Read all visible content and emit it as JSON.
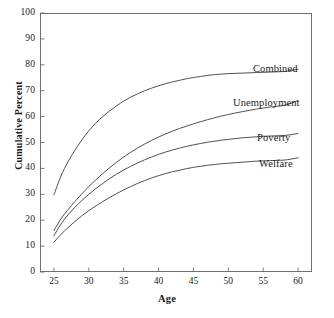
{
  "chart_data": {
    "type": "line",
    "title": "",
    "xlabel": "Age",
    "ylabel": "Cumulative Percent",
    "xlim": [
      23,
      62
    ],
    "ylim": [
      0,
      100
    ],
    "xticks": [
      25,
      30,
      35,
      40,
      45,
      50,
      55,
      60
    ],
    "yticks": [
      0,
      10,
      20,
      30,
      40,
      50,
      60,
      70,
      80,
      90,
      100
    ],
    "grid": false,
    "legend": "inline-right-labels",
    "line_color": "#3c3c3c",
    "x": [
      25,
      26,
      27,
      28,
      29,
      30,
      31,
      32,
      33,
      34,
      35,
      36,
      37,
      38,
      39,
      40,
      41,
      42,
      43,
      44,
      45,
      46,
      47,
      48,
      49,
      50,
      51,
      52,
      53,
      54,
      55,
      56,
      57,
      58,
      59,
      60
    ],
    "series": [
      {
        "name": "Combined",
        "label": "Combined",
        "values": [
          29.8,
          37.0,
          42.5,
          47.0,
          51.0,
          54.5,
          57.5,
          60.0,
          62.2,
          64.2,
          66.0,
          67.5,
          68.8,
          70.0,
          71.0,
          71.9,
          72.7,
          73.4,
          74.0,
          74.6,
          75.1,
          75.5,
          75.9,
          76.2,
          76.4,
          76.6,
          76.7,
          76.8,
          76.9,
          77.0,
          77.1,
          77.2,
          77.3,
          77.4,
          77.8,
          78.3
        ]
      },
      {
        "name": "Unemployment",
        "label": "Unemployment",
        "values": [
          16.0,
          20.5,
          24.0,
          27.2,
          30.2,
          33.0,
          35.6,
          38.0,
          40.3,
          42.4,
          44.4,
          46.2,
          47.9,
          49.4,
          50.8,
          52.1,
          53.3,
          54.4,
          55.4,
          56.3,
          57.2,
          58.0,
          58.8,
          59.5,
          60.2,
          60.8,
          61.4,
          61.9,
          62.4,
          62.9,
          63.3,
          63.7,
          64.0,
          64.3,
          65.1,
          66.2
        ]
      },
      {
        "name": "Poverty",
        "label": "Poverty",
        "values": [
          14.0,
          18.5,
          22.0,
          25.0,
          27.6,
          30.0,
          32.2,
          34.2,
          36.1,
          37.8,
          39.4,
          40.8,
          42.1,
          43.3,
          44.4,
          45.4,
          46.3,
          47.1,
          47.8,
          48.5,
          49.1,
          49.6,
          50.1,
          50.5,
          50.9,
          51.2,
          51.5,
          51.8,
          52.0,
          52.2,
          52.4,
          52.5,
          52.6,
          52.7,
          53.0,
          53.5
        ]
      },
      {
        "name": "Welfare",
        "label": "Welfare",
        "values": [
          11.5,
          14.5,
          17.1,
          19.5,
          21.7,
          23.7,
          25.5,
          27.2,
          28.8,
          30.3,
          31.7,
          33.0,
          34.2,
          35.3,
          36.3,
          37.2,
          38.0,
          38.7,
          39.3,
          39.9,
          40.4,
          40.8,
          41.2,
          41.5,
          41.8,
          42.0,
          42.2,
          42.4,
          42.6,
          42.8,
          42.9,
          43.0,
          43.1,
          43.2,
          43.6,
          44.1
        ]
      }
    ],
    "series_label_positions": [
      {
        "name": "Combined",
        "x": 253,
        "y": 63
      },
      {
        "name": "Unemployment",
        "x": 233,
        "y": 97
      },
      {
        "name": "Poverty",
        "x": 257,
        "y": 132
      },
      {
        "name": "Welfare",
        "x": 259,
        "y": 158
      }
    ]
  },
  "caption": ""
}
